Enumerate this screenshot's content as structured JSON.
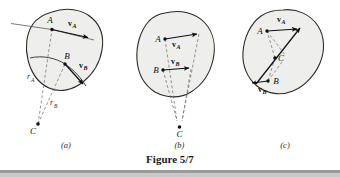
{
  "figure": {
    "caption": "Figure 5/7",
    "panels": [
      {
        "id": "a",
        "label": "(a)",
        "points": [
          {
            "name": "A",
            "label": "A"
          },
          {
            "name": "B",
            "label": "B"
          },
          {
            "name": "C",
            "label": "C"
          }
        ],
        "vectors": [
          {
            "name": "v_A",
            "base": "v",
            "sub": "A"
          },
          {
            "name": "v_B",
            "base": "v",
            "sub": "B"
          }
        ],
        "radii": [
          {
            "name": "r_A",
            "base": "r",
            "sub": "A"
          },
          {
            "name": "r_B",
            "base": "r",
            "sub": "B"
          }
        ]
      },
      {
        "id": "b",
        "label": "(b)",
        "points": [
          {
            "name": "A",
            "label": "A"
          },
          {
            "name": "B",
            "label": "B"
          },
          {
            "name": "C",
            "label": "C"
          }
        ],
        "vectors": [
          {
            "name": "v_A",
            "base": "v",
            "sub": "A"
          },
          {
            "name": "v_B",
            "base": "v",
            "sub": "B"
          }
        ],
        "radii": []
      },
      {
        "id": "c",
        "label": "(c)",
        "points": [
          {
            "name": "A",
            "label": "A"
          },
          {
            "name": "B",
            "label": "B"
          },
          {
            "name": "C",
            "label": "C"
          }
        ],
        "vectors": [
          {
            "name": "v_A",
            "base": "v",
            "sub": "A"
          },
          {
            "name": "v_B",
            "base": "v",
            "sub": "B"
          }
        ],
        "radii": []
      }
    ]
  },
  "colors": {
    "page_background": "#ffffff",
    "body_fill": "#eeeeec",
    "body_stroke": "#2b2b2b",
    "ink": "#111111",
    "dashed": "#6a6a6a",
    "footer_bar": "#9a9a9a"
  }
}
